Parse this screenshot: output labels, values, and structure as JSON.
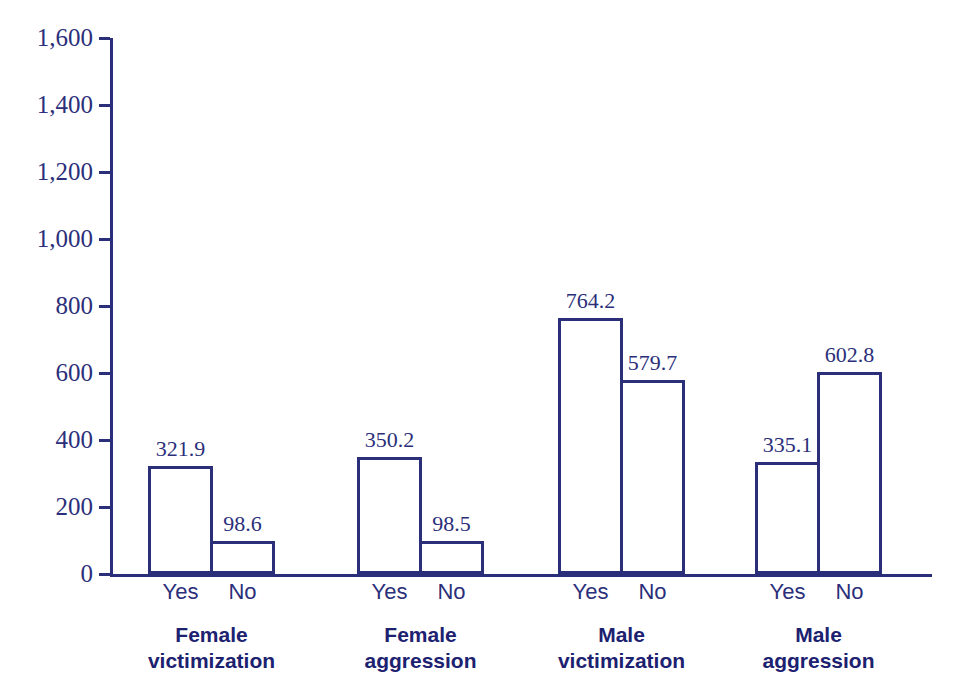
{
  "chart_data": {
    "type": "bar",
    "title": "",
    "subtitle": "",
    "xlabel": "",
    "ylabel": "",
    "ylim": [
      0,
      1600
    ],
    "ytick_values": [
      0,
      200,
      400,
      600,
      800,
      1000,
      1200,
      1400,
      1600
    ],
    "ytick_labels": [
      "0",
      "200",
      "400",
      "600",
      "800",
      "1,000",
      "1,200",
      "1,400",
      "1,600"
    ],
    "grid": false,
    "legend": false,
    "categories": [
      "Yes",
      "No"
    ],
    "groups": [
      {
        "label_line1": "Female",
        "label_line2": "victimization",
        "bars": [
          {
            "category": "Yes",
            "value": 321.9,
            "value_label": "321.9"
          },
          {
            "category": "No",
            "value": 98.6,
            "value_label": "98.6"
          }
        ]
      },
      {
        "label_line1": "Female",
        "label_line2": "aggression",
        "bars": [
          {
            "category": "Yes",
            "value": 350.2,
            "value_label": "350.2"
          },
          {
            "category": "No",
            "value": 98.5,
            "value_label": "98.5"
          }
        ]
      },
      {
        "label_line1": "Male",
        "label_line2": "victimization",
        "bars": [
          {
            "category": "Yes",
            "value": 764.2,
            "value_label": "764.2"
          },
          {
            "category": "No",
            "value": 579.7,
            "value_label": "579.7"
          }
        ]
      },
      {
        "label_line1": "Male",
        "label_line2": "aggression",
        "bars": [
          {
            "category": "Yes",
            "value": 335.1,
            "value_label": "335.1"
          },
          {
            "category": "No",
            "value": 602.8,
            "value_label": "602.8"
          }
        ]
      }
    ],
    "colors": {
      "line": "#2b2f7a",
      "bar_fill": "#ffffff",
      "text": "#2b2f7a",
      "group_label": "#1c2170",
      "background": "#ffffff"
    }
  }
}
